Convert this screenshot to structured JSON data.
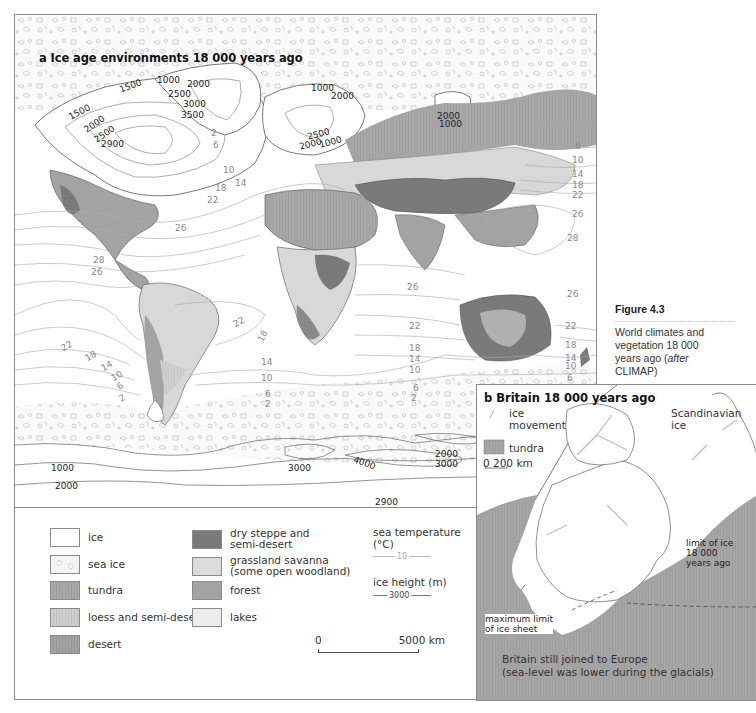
{
  "figure": {
    "number": "Figure 4.3",
    "caption_line1": "World climates and",
    "caption_line2": "vegetation 18 000",
    "caption_line3a": "years ago (",
    "caption_line3b": "after",
    "caption_line4": "CLIMAP)"
  },
  "panel_a": {
    "title": "a Ice age environments 18 000 years ago",
    "ice_height_labels": {
      "north_america": [
        "1500",
        "1500",
        "2000",
        "2500",
        "2900"
      ],
      "greenland": [
        "1000",
        "2000",
        "2500",
        "3000",
        "3500"
      ],
      "scandinavia": [
        "1000",
        "2000",
        "2500",
        "2000",
        "1000"
      ],
      "siberia": [
        "2000",
        "1000"
      ],
      "antarctica": [
        "1000",
        "2000",
        "3000",
        "4000",
        "2900",
        "2000",
        "3000"
      ]
    },
    "sea_temperature_labels": {
      "north_atlantic": [
        "2",
        "6",
        "10",
        "14",
        "18",
        "22",
        "26"
      ],
      "north_pacific_east": [
        "6",
        "10",
        "14",
        "18",
        "22",
        "26",
        "28"
      ],
      "caribbean": [
        "28",
        "26"
      ],
      "south_pacific": [
        "22",
        "18",
        "14",
        "10",
        "6",
        "2"
      ],
      "south_atlantic": [
        "22",
        "18",
        "14",
        "10",
        "6",
        "2"
      ],
      "indian_ocean": [
        "26",
        "22",
        "18",
        "14",
        "10",
        "6",
        "2"
      ],
      "australia": [
        "26",
        "22",
        "18",
        "14",
        "10",
        "6"
      ]
    },
    "legend": {
      "items": [
        {
          "label": "ice",
          "color": "#ffffff"
        },
        {
          "label": "sea ice",
          "color": "#f4f4f4"
        },
        {
          "label": "tundra",
          "color": "#a9a9a9"
        },
        {
          "label": "loess and semi-desert",
          "color": "#cfcfcf"
        },
        {
          "label": "desert",
          "color": "#a0a0a0"
        },
        {
          "label": "dry steppe and",
          "label2": "semi-desert",
          "color": "#7a7a7a"
        },
        {
          "label": "grassland savanna",
          "label2": "(some open woodland)",
          "color": "#dcdcdc"
        },
        {
          "label": "forest",
          "color": "#a3a3a3"
        },
        {
          "label": "lakes",
          "color": "#ececec"
        }
      ],
      "sea_temperature_label": "sea temperature",
      "sea_temperature_unit": "(°C)",
      "sea_temperature_sample": "10",
      "ice_height_label": "ice height (m)",
      "ice_height_sample": "3000",
      "scale_start": "0",
      "scale_end": "5000 km"
    }
  },
  "panel_b": {
    "title": "b Britain 18 000 years ago",
    "legend_ice_movement_1": "ice",
    "legend_ice_movement_2": "movement",
    "legend_tundra": "tundra",
    "scale_start": "0",
    "scale_end": "200 km",
    "scandinavian_1": "Scandinavian",
    "scandinavian_2": "ice",
    "limit_1": "limit of ice",
    "limit_2": "18 000",
    "limit_3": "years ago",
    "max_limit_1": "maximum limit",
    "max_limit_2": "of ice sheet",
    "note_1": "Britain still joined to Europe",
    "note_2": "(sea-level was lower during the glacials)"
  },
  "colors": {
    "frame": "#8a8a8a",
    "tundra": "#a9a9a9",
    "desert": "#9c9c9c",
    "dry_steppe": "#7a7a7a",
    "forest": "#a3a3a3",
    "grassland": "#dcdcdc",
    "loess": "#cfcfcf",
    "contour_sea": "#9a9a9a",
    "contour_ice": "#555555"
  }
}
